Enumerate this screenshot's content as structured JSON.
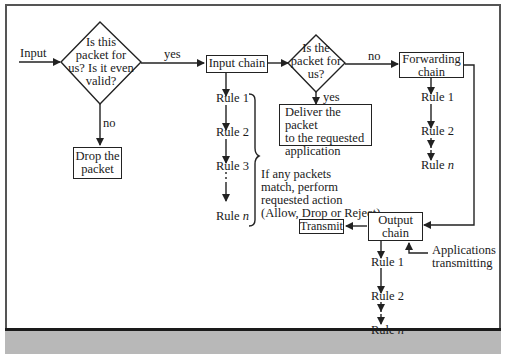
{
  "diagram": {
    "type": "flowchart",
    "input_label": "Input",
    "decision1": {
      "lines": [
        "Is this",
        "packet for",
        "us? Is it even",
        "valid?"
      ],
      "yes": "yes",
      "no": "no"
    },
    "drop_box": {
      "lines": [
        "Drop the",
        "packet"
      ]
    },
    "input_chain": {
      "label": "Input chain",
      "rules": [
        "Rule 1",
        "Rule 2",
        "Rule 3",
        "Rule"
      ],
      "rule_n": "n"
    },
    "decision2": {
      "lines": [
        "Is the",
        "packet for",
        "us?"
      ],
      "yes": "yes",
      "no": "no"
    },
    "deliver_box": {
      "lines": [
        "Deliver the packet",
        "to the requested",
        "application"
      ]
    },
    "forwarding_chain": {
      "lines": [
        "Forwarding",
        "chain"
      ],
      "rules": [
        "Rule 1",
        "Rule 2",
        "Rule"
      ],
      "rule_n": "n"
    },
    "brace_note": {
      "lines": [
        "If any packets",
        "match, perform",
        "requested action",
        "(Allow, Drop or Reject)"
      ]
    },
    "transmit_box": {
      "label": "Transmit"
    },
    "output_chain": {
      "lines": [
        "Output",
        "chain"
      ],
      "rules": [
        "Rule 1",
        "Rule 2",
        "Rule"
      ],
      "rule_n": "n"
    },
    "apps_note": {
      "lines": [
        "Applications",
        "transmitting"
      ]
    }
  },
  "colors": {
    "line": "#222222",
    "frame": "#555555",
    "band": "#b8b8b8"
  }
}
